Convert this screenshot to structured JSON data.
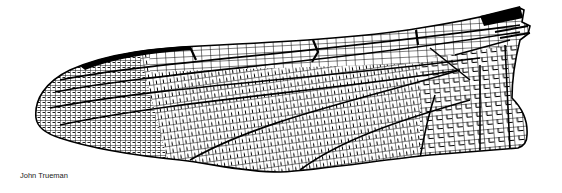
{
  "figure": {
    "credit": "John Trueman",
    "colors": {
      "ink": "#000000",
      "background": "#ffffff"
    }
  }
}
